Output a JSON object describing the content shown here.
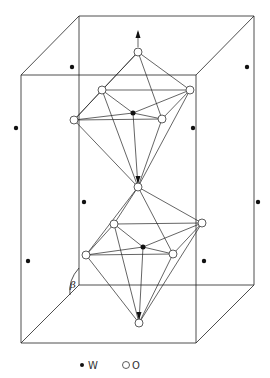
{
  "figure": {
    "type": "crystal-structure-unit-cell",
    "angle_label": "β",
    "legend": [
      {
        "symbol": "filled-dot",
        "label": "W"
      },
      {
        "symbol": "open-circle",
        "label": "O"
      }
    ]
  },
  "unit_cell": {
    "back_face": [
      [
        79,
        16
      ],
      [
        254,
        16
      ],
      [
        254,
        285
      ],
      [
        79,
        285
      ]
    ],
    "front_face": [
      [
        21,
        75
      ],
      [
        196,
        75
      ],
      [
        196,
        343
      ],
      [
        21,
        343
      ]
    ]
  },
  "octahedra": [
    {
      "name": "upper",
      "center_W": [
        133,
        113
      ],
      "O": {
        "top": [
          138,
          52
        ],
        "upper_left": [
          102,
          90
        ],
        "upper_right": [
          190,
          90
        ],
        "left": [
          74,
          120
        ],
        "front_right": [
          162,
          119
        ],
        "bottom": [
          138,
          187
        ]
      }
    },
    {
      "name": "lower",
      "center_W": [
        143,
        247
      ],
      "O": {
        "top": [
          138,
          187
        ],
        "upper_left": [
          114,
          224
        ],
        "upper_right": [
          202,
          223
        ],
        "left": [
          86,
          255
        ],
        "front_right": [
          173,
          254
        ],
        "bottom": [
          139,
          323
        ]
      }
    }
  ],
  "isolated_W": [
    [
      72,
      67
    ],
    [
      247,
      67
    ],
    [
      16,
      128
    ],
    [
      193,
      128
    ],
    [
      84,
      202
    ],
    [
      258,
      202
    ],
    [
      28,
      261
    ],
    [
      204,
      261
    ]
  ],
  "legend_items": {
    "w_label": "W",
    "o_label": "O"
  }
}
